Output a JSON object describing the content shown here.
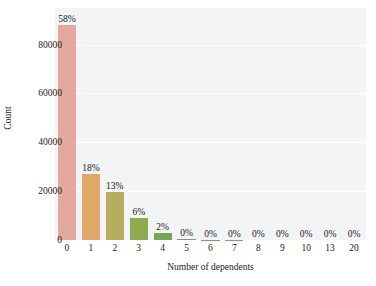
{
  "chart_data": {
    "type": "bar",
    "title": "",
    "subtitle": "",
    "xlabel": "Number of dependents",
    "ylabel": "Count",
    "categories": [
      "0",
      "1",
      "2",
      "3",
      "4",
      "5",
      "6",
      "7",
      "8",
      "9",
      "10",
      "13",
      "20"
    ],
    "values": [
      88000,
      27000,
      19500,
      9000,
      3000,
      400,
      150,
      60,
      30,
      15,
      10,
      5,
      3
    ],
    "data_labels": [
      "58%",
      "18%",
      "13%",
      "6%",
      "2%",
      "0%",
      "0%",
      "0%",
      "0%",
      "0%",
      "0%",
      "0%",
      "0%"
    ],
    "percentages": [
      58,
      18,
      13,
      6,
      2,
      0,
      0,
      0,
      0,
      0,
      0,
      0,
      0
    ],
    "bar_colors": [
      "#e3a99f",
      "#e0a868",
      "#b5ae5f",
      "#8faa4f",
      "#74a84f",
      "#6aa75c",
      "#6aa75c",
      "#6aa75c",
      "#6aa75c",
      "#6aa75c",
      "#6aa75c",
      "#6aa75c",
      "#6aa75c"
    ],
    "ylim": [
      0,
      95000
    ],
    "yticks": [
      0,
      20000,
      40000,
      60000,
      80000
    ],
    "ytick_labels": [
      "0",
      "20000",
      "40000",
      "60000",
      "80000"
    ],
    "grid": true,
    "grid_axis": "y",
    "legend": false,
    "legend_position": "none",
    "plot_background": "#f2f4f5",
    "figure_background": "#ffffff",
    "text_color": "#1a1a1a"
  }
}
